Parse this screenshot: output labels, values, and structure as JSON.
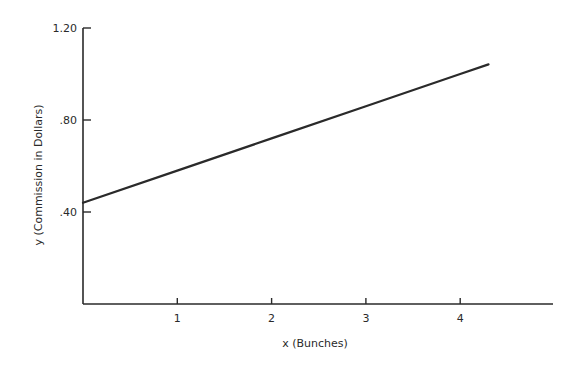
{
  "chart_data": {
    "type": "line",
    "title": "",
    "xlabel": "x (Bunches)",
    "ylabel": "y (Commission in Dollars)",
    "xlim": [
      0,
      5
    ],
    "ylim": [
      0,
      1.2
    ],
    "x_ticks": [
      1,
      2,
      3,
      4
    ],
    "x_tick_labels": [
      "1",
      "2",
      "3",
      "4"
    ],
    "y_ticks": [
      0.4,
      0.8,
      1.2
    ],
    "y_tick_labels": [
      ".40",
      ".80",
      "1.20"
    ],
    "grid": false,
    "legend": null,
    "series": [
      {
        "name": "commission",
        "equation": "y = 0.14x + 0.44",
        "x": [
          0,
          1,
          2,
          3,
          4,
          4.3
        ],
        "y": [
          0.44,
          0.58,
          0.72,
          0.86,
          1.0,
          1.042
        ]
      }
    ]
  },
  "colors": {
    "axis": "#2a2a2a",
    "line": "#2a2a2a"
  }
}
